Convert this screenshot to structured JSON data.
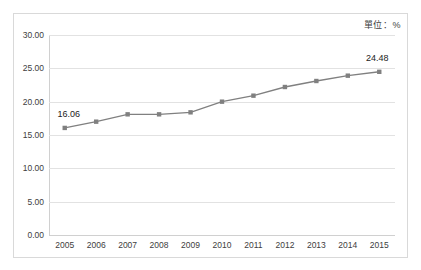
{
  "unit_note": "單位：%",
  "chart_data": {
    "type": "line",
    "title": "",
    "subtitle": "",
    "xlabel": "",
    "ylabel": "",
    "unit": "%",
    "categories": [
      "2005",
      "2006",
      "2007",
      "2008",
      "2009",
      "2010",
      "2011",
      "2012",
      "2013",
      "2014",
      "2015"
    ],
    "values": [
      16.06,
      17.0,
      18.1,
      18.1,
      18.4,
      20.0,
      20.9,
      22.2,
      23.1,
      23.9,
      24.48
    ],
    "series": [
      {
        "name": "",
        "values": [
          16.06,
          17.0,
          18.1,
          18.1,
          18.4,
          20.0,
          20.9,
          22.2,
          23.1,
          23.9,
          24.48
        ]
      }
    ],
    "point_labels": [
      {
        "category": "2005",
        "value": 16.06,
        "text": "16.06"
      },
      {
        "category": "2015",
        "value": 24.48,
        "text": "24.48"
      }
    ],
    "ylim": [
      0,
      30
    ],
    "ytick_step": 5,
    "ytick_labels": [
      "0.00",
      "5.00",
      "10.00",
      "15.00",
      "20.00",
      "25.00",
      "30.00"
    ],
    "ytick_values": [
      0,
      5,
      10,
      15,
      20,
      25,
      30
    ],
    "xtick_labels": [
      "2005",
      "2006",
      "2007",
      "2008",
      "2009",
      "2010",
      "2011",
      "2012",
      "2013",
      "2014",
      "2015"
    ],
    "grid": true,
    "grid_axis": "y",
    "legend": false,
    "legend_position": "none",
    "marker": "square",
    "colors": {
      "line": "#808080",
      "marker": "#808080",
      "grid": "#e2e2e2",
      "axis": "#d0d0d0",
      "border": "#d9d9d9",
      "text": "#404040",
      "background": "#ffffff"
    }
  }
}
